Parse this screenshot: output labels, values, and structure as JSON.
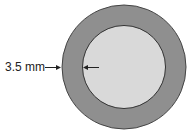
{
  "diagram": {
    "label": "3.5 mm",
    "colors": {
      "outer_ring": "#8f8f8f",
      "inner_disc": "#d9d9d9",
      "stroke": "#333333",
      "arrow": "#222222"
    }
  }
}
